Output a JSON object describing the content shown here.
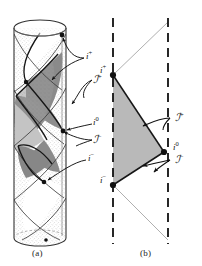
{
  "figure": {
    "panels": [
      {
        "id": "a",
        "caption": "(a)",
        "description": "Minkowski space conformally embedded in the Einstein static cylinder",
        "labels": [
          {
            "name": "future-timelike-infinity",
            "text": "i",
            "sup": "+"
          },
          {
            "name": "future-null-infinity",
            "text": "ℐ",
            "sup": "+"
          },
          {
            "name": "spatial-infinity",
            "text": "i",
            "sup": "0"
          },
          {
            "name": "past-null-infinity",
            "text": "ℐ",
            "sup": "−"
          },
          {
            "name": "past-timelike-infinity",
            "text": "i",
            "sup": "−"
          }
        ]
      },
      {
        "id": "b",
        "caption": "(b)",
        "description": "Penrose diagram of Minkowski space",
        "labels": [
          {
            "name": "future-timelike-infinity",
            "text": "i",
            "sup": "+"
          },
          {
            "name": "future-null-infinity",
            "text": "ℐ",
            "sup": "+"
          },
          {
            "name": "spatial-infinity",
            "text": "i",
            "sup": "0"
          },
          {
            "name": "past-null-infinity",
            "text": "ℐ",
            "sup": "−"
          },
          {
            "name": "past-timelike-infinity",
            "text": "i",
            "sup": "−"
          }
        ]
      }
    ],
    "colors": {
      "ink": "#1a1a1a",
      "diamond_fill_dark": "#8f8f8f",
      "diamond_fill_light": "#bdbdbd",
      "stipple": "#c9c9c9",
      "cylinder_line": "#4a4a4a",
      "dashed_axis": "#111111",
      "thin_ray": "#9a9a9a",
      "background": "#ffffff"
    }
  }
}
